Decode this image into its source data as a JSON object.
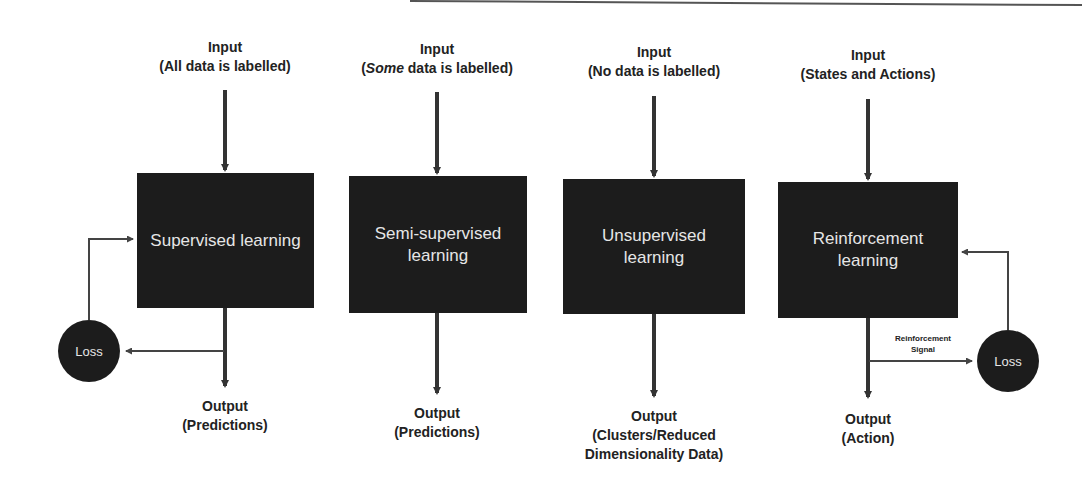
{
  "diagram": {
    "type": "machine-learning-paradigms",
    "columns": [
      {
        "id": "supervised",
        "input_title": "Input",
        "input_detail": "(All data is labelled)",
        "box_label": "Supervised learning",
        "output_title": "Output",
        "output_detail": "(Predictions)",
        "feedback": {
          "node": "Loss",
          "direction": "output-to-loss-to-model"
        }
      },
      {
        "id": "semi-supervised",
        "input_title": "Input",
        "input_detail_italic": "Some",
        "input_detail_rest": " data is labelled)",
        "input_detail_open": "(",
        "box_label_line1": "Semi-supervised",
        "box_label_line2": "learning",
        "output_title": "Output",
        "output_detail": "(Predictions)"
      },
      {
        "id": "unsupervised",
        "input_title": "Input",
        "input_detail": "(No data is labelled)",
        "box_label_line1": "Unsupervised",
        "box_label_line2": "learning",
        "output_title": "Output",
        "output_detail_line1": "(Clusters/Reduced",
        "output_detail_line2": "Dimensionality Data)"
      },
      {
        "id": "reinforcement",
        "input_title": "Input",
        "input_detail": "(States and Actions)",
        "box_label_line1": "Reinforcement",
        "box_label_line2": "learning",
        "output_title": "Output",
        "output_detail": "(Action)",
        "feedback": {
          "node": "Loss",
          "edge_label_line1": "Reinforcement",
          "edge_label_line2": "Signal"
        }
      }
    ],
    "colors": {
      "box": "#1c1c1c",
      "box_text": "#e6e6e6",
      "arrow": "#333333",
      "background": "#ffffff"
    }
  }
}
